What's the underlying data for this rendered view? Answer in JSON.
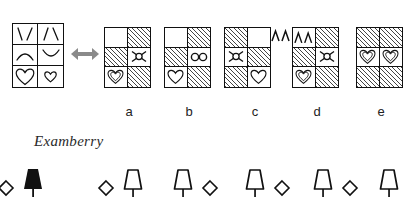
{
  "question": {
    "relation_icon": "double-headed-arrow-icon",
    "source_matrix": {
      "name": "source-matrix",
      "columns": 2,
      "rows": 3,
      "cells": [
        {
          "glyph": "v-shape-glyph",
          "label": "\\/",
          "fill": "white"
        },
        {
          "glyph": "lambda-shape-glyph",
          "label": "/\\",
          "fill": "white"
        },
        {
          "glyph": "arch-up-glyph",
          "label": "∧",
          "fill": "white"
        },
        {
          "glyph": "arch-down-glyph",
          "label": "∨",
          "fill": "white"
        },
        {
          "glyph": "heart-large-glyph",
          "label": "♡",
          "fill": "white"
        },
        {
          "glyph": "heart-small-glyph",
          "label": "♡",
          "fill": "white"
        }
      ]
    }
  },
  "options": [
    {
      "id": "a",
      "label": "a",
      "outer_glyph": {
        "name": "double-lambda-glyph",
        "label": "ΛΛ"
      },
      "cells": [
        {
          "fill": "white",
          "glyph": "empty"
        },
        {
          "fill": "hatched",
          "glyph": "empty"
        },
        {
          "fill": "hatched",
          "glyph": "empty"
        },
        {
          "fill": "white",
          "glyph": "bowtie-glyph"
        },
        {
          "fill": "white",
          "glyph": "heart-double-glyph"
        },
        {
          "fill": "hatched",
          "glyph": "empty"
        }
      ]
    },
    {
      "id": "b",
      "label": "b",
      "outer_glyph": {
        "name": "double-x-glyph",
        "label": "ΧΧ"
      },
      "cells": [
        {
          "fill": "white",
          "glyph": "empty"
        },
        {
          "fill": "hatched",
          "glyph": "empty"
        },
        {
          "fill": "hatched",
          "glyph": "empty"
        },
        {
          "fill": "white",
          "glyph": "infinity-glyph"
        },
        {
          "fill": "white",
          "glyph": "heart-outline-glyph"
        },
        {
          "fill": "hatched",
          "glyph": "empty"
        }
      ]
    },
    {
      "id": "c",
      "label": "c",
      "outer_glyph": {
        "name": "double-lambda-glyph",
        "label": "ΛΛ"
      },
      "cells": [
        {
          "fill": "hatched",
          "glyph": "empty"
        },
        {
          "fill": "white",
          "glyph": "empty"
        },
        {
          "fill": "white",
          "glyph": "bowtie-glyph"
        },
        {
          "fill": "hatched",
          "glyph": "empty"
        },
        {
          "fill": "hatched",
          "glyph": "empty"
        },
        {
          "fill": "white",
          "glyph": "heart-outline-glyph"
        }
      ]
    },
    {
      "id": "d",
      "label": "d",
      "outer_glyph": null,
      "cells": [
        {
          "fill": "white",
          "glyph": "double-lambda-glyph"
        },
        {
          "fill": "hatched",
          "glyph": "empty"
        },
        {
          "fill": "hatched",
          "glyph": "empty"
        },
        {
          "fill": "white",
          "glyph": "bowtie-glyph"
        },
        {
          "fill": "white",
          "glyph": "heart-double-glyph"
        },
        {
          "fill": "hatched",
          "glyph": "empty"
        }
      ]
    },
    {
      "id": "e",
      "label": "e",
      "outer_glyph": null,
      "cells": [
        {
          "fill": "hatched",
          "glyph": "empty"
        },
        {
          "fill": "hatched",
          "glyph": "empty"
        },
        {
          "fill": "white",
          "glyph": "heart-double-glyph"
        },
        {
          "fill": "white",
          "glyph": "heart-double-glyph"
        },
        {
          "fill": "hatched",
          "glyph": "empty"
        },
        {
          "fill": "hatched",
          "glyph": "empty"
        }
      ]
    }
  ],
  "watermark": {
    "text": "Examberry"
  },
  "icon_strip": [
    {
      "order": [
        "diamond-outline-icon",
        "lamp-filled-icon"
      ]
    },
    {
      "order": [
        "diamond-outline-icon",
        "lamp-outline-icon"
      ]
    },
    {
      "order": [
        "lamp-outline-icon",
        "diamond-outline-icon"
      ]
    },
    {
      "order": [
        "lamp-outline-icon",
        "diamond-outline-icon"
      ]
    },
    {
      "order": [
        "lamp-outline-icon",
        "diamond-outline-icon"
      ]
    },
    {
      "order": [
        "lamp-outline-icon"
      ]
    }
  ],
  "colors": {
    "ink": "#111111",
    "hatch": "#444444",
    "arrow": "#8a8a8a",
    "paper": "#ffffff"
  }
}
